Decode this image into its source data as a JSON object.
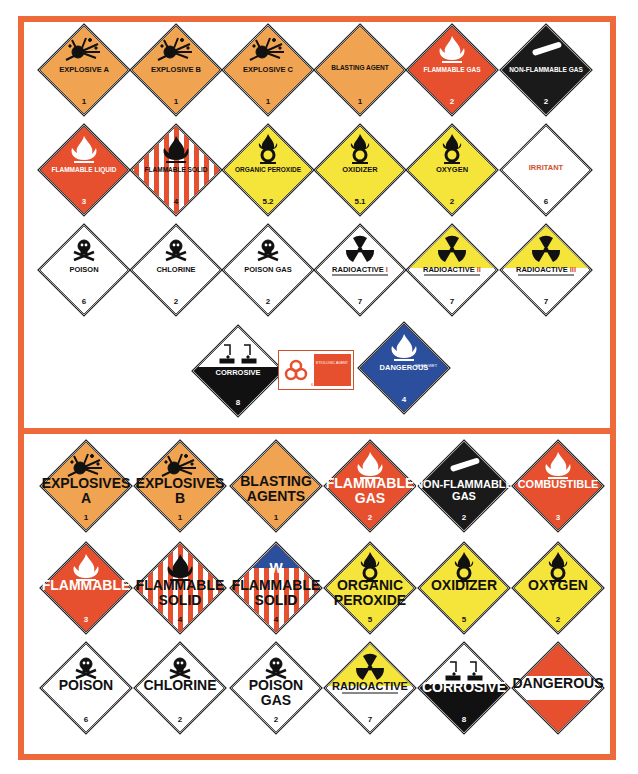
{
  "colors": {
    "frame": "#ef6a3a",
    "explosive": "#f0a350",
    "flammable": "#e6502e",
    "oxidizer": "#f5e43a",
    "nonflammable": "#1a1a1a",
    "dangerous_when_wet": "#2b4f9c",
    "white": "#ffffff",
    "black": "#111111"
  },
  "top_panel": {
    "rows": [
      [
        {
          "text": "EXPLOSIVE A",
          "cls": "1",
          "bg": "explosive",
          "icon": "explosion-icon"
        },
        {
          "text": "EXPLOSIVE B",
          "cls": "1",
          "bg": "explosive",
          "icon": "explosion-icon"
        },
        {
          "text": "EXPLOSIVE C",
          "cls": "1",
          "bg": "explosive",
          "icon": "explosion-icon"
        },
        {
          "text": "BLASTING AGENT",
          "cls": "1",
          "bg": "explosive",
          "icon": ""
        },
        {
          "text": "FLAMMABLE GAS",
          "cls": "2",
          "bg": "flammable",
          "icon": "flame-icon"
        },
        {
          "text": "NON-FLAMMABLE GAS",
          "cls": "2",
          "bg": "nonflammable",
          "icon": "gas-cylinder-icon"
        }
      ],
      [
        {
          "text": "FLAMMABLE LIQUID",
          "cls": "3",
          "bg": "flammable",
          "icon": "flame-icon"
        },
        {
          "text": "FLAMMABLE SOLID",
          "cls": "4",
          "bg": "striped",
          "icon": "flame-icon"
        },
        {
          "text": "ORGANIC PEROXIDE",
          "cls": "5.2",
          "bg": "oxidizer",
          "icon": "flame-over-circle-icon"
        },
        {
          "text": "OXIDIZER",
          "cls": "5.1",
          "bg": "oxidizer",
          "icon": "flame-over-circle-icon"
        },
        {
          "text": "OXYGEN",
          "cls": "2",
          "bg": "oxidizer",
          "icon": "flame-over-circle-icon"
        },
        {
          "text": "IRRITANT",
          "cls": "6",
          "bg": "white",
          "icon": ""
        }
      ],
      [
        {
          "text": "POISON",
          "cls": "6",
          "bg": "white",
          "icon": "skull-crossbones-icon"
        },
        {
          "text": "CHLORINE",
          "cls": "2",
          "bg": "white",
          "icon": "skull-crossbones-icon"
        },
        {
          "text": "POISON GAS",
          "cls": "2",
          "bg": "white",
          "icon": "skull-crossbones-icon"
        },
        {
          "text": "RADIOACTIVE",
          "suffix": "I",
          "cls": "7",
          "bg": "white",
          "icon": "radiation-trefoil-icon"
        },
        {
          "text": "RADIOACTIVE",
          "suffix": "II",
          "cls": "7",
          "bg": "radio-yellow",
          "icon": "radiation-trefoil-icon"
        },
        {
          "text": "RADIOACTIVE",
          "suffix": "III",
          "cls": "7",
          "bg": "radio-yellow",
          "icon": "radiation-trefoil-icon"
        }
      ],
      [
        {
          "text": "CORROSIVE",
          "cls": "8",
          "bg": "corrosive",
          "icon": "corrosion-icon"
        },
        {
          "text": "ETIOLOGIC AGENT",
          "cls": "6",
          "bg": "biohazard-label",
          "icon": "biohazard-icon"
        },
        {
          "text": "DANGEROUS",
          "subtext": "WHEN WET",
          "cls": "4",
          "bg": "dangerous_when_wet",
          "icon": "flame-icon"
        }
      ]
    ]
  },
  "bottom_panel": {
    "rows": [
      [
        {
          "text": "EXPLOSIVES",
          "line2": "A",
          "cls": "1",
          "bg": "explosive",
          "icon": "explosion-icon"
        },
        {
          "text": "EXPLOSIVES",
          "line2": "B",
          "cls": "1",
          "bg": "explosive",
          "icon": "explosion-icon"
        },
        {
          "text": "BLASTING",
          "line2": "AGENTS",
          "cls": "1",
          "bg": "explosive",
          "icon": ""
        },
        {
          "text": "FLAMMABLE",
          "line2": "GAS",
          "cls": "2",
          "bg": "flammable",
          "icon": "flame-icon"
        },
        {
          "text": "NON-FLAMMABLE",
          "line2": "GAS",
          "cls": "2",
          "bg": "nonflammable",
          "icon": "gas-cylinder-icon"
        },
        {
          "text": "COMBUSTIBLE",
          "line2": "",
          "cls": "3",
          "bg": "flammable",
          "icon": "flame-icon"
        }
      ],
      [
        {
          "text": "FLAMMABLE",
          "line2": "",
          "cls": "3",
          "bg": "flammable",
          "icon": "flame-icon"
        },
        {
          "text": "FLAMMABLE",
          "line2": "SOLID",
          "cls": "4",
          "bg": "striped",
          "icon": "flame-icon"
        },
        {
          "text": "FLAMMABLE",
          "line2": "SOLID",
          "cls": "4",
          "bg": "striped-blue",
          "icon": "w-icon"
        },
        {
          "text": "ORGANIC",
          "line2": "PEROXIDE",
          "cls": "5",
          "bg": "oxidizer",
          "icon": "flame-over-circle-icon"
        },
        {
          "text": "OXIDIZER",
          "line2": "",
          "cls": "5",
          "bg": "oxidizer",
          "icon": "flame-over-circle-icon"
        },
        {
          "text": "OXYGEN",
          "line2": "",
          "cls": "2",
          "bg": "oxidizer",
          "icon": "flame-over-circle-icon"
        }
      ],
      [
        {
          "text": "POISON",
          "line2": "",
          "cls": "6",
          "bg": "white",
          "icon": "skull-crossbones-icon"
        },
        {
          "text": "CHLORINE",
          "line2": "",
          "cls": "2",
          "bg": "white",
          "icon": "skull-crossbones-icon"
        },
        {
          "text": "POISON",
          "line2": "GAS",
          "cls": "2",
          "bg": "white",
          "icon": "skull-crossbones-icon"
        },
        {
          "text": "RADIOACTIVE",
          "line2": "",
          "cls": "7",
          "bg": "radio-yellow",
          "icon": "radiation-trefoil-icon"
        },
        {
          "text": "CORROSIVE",
          "line2": "",
          "cls": "8",
          "bg": "corrosive",
          "icon": "corrosion-icon"
        },
        {
          "text": "DANGEROUS",
          "line2": "",
          "cls": "",
          "bg": "dangerous-stripes",
          "icon": ""
        }
      ]
    ]
  }
}
